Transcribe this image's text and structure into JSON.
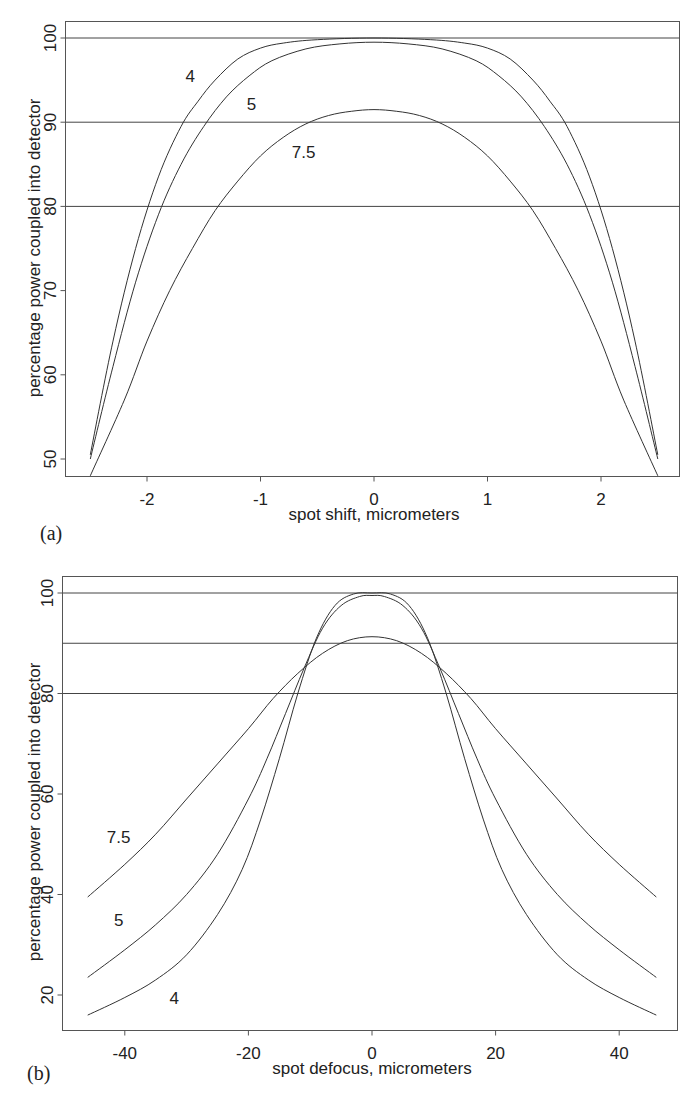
{
  "figure": {
    "panels": [
      "(a)",
      "(b)"
    ]
  },
  "chart_data": [
    {
      "type": "line",
      "panel_label": "(a)",
      "title": "",
      "xlabel": "spot shift, micrometers",
      "ylabel": "percentage power coupled into detector",
      "xlim": [
        -2.7,
        2.7
      ],
      "ylim": [
        48,
        102
      ],
      "xticks": [
        -2,
        -1,
        0,
        1,
        2
      ],
      "yticks": [
        50,
        60,
        70,
        80,
        90,
        100
      ],
      "grid": false,
      "reference_lines_y": [
        80,
        90,
        100
      ],
      "legend": "inline curve labels",
      "series": [
        {
          "name": "4",
          "label_pos": [
            -1.62,
            95.5
          ],
          "x": [
            -2.5,
            -2.3,
            -2.1,
            -1.9,
            -1.7,
            -1.55,
            -1.4,
            -1.2,
            -1.0,
            -0.8,
            -0.5,
            0,
            0.5,
            0.8,
            1.0,
            1.2,
            1.4,
            1.55,
            1.7,
            1.9,
            2.1,
            2.3,
            2.5
          ],
          "y": [
            50.5,
            64,
            75,
            83.5,
            89.5,
            92.5,
            95,
            97.5,
            98.8,
            99.4,
            99.8,
            100,
            99.8,
            99.4,
            98.8,
            97.5,
            95,
            92.5,
            89.5,
            83.5,
            75,
            64,
            50.5
          ]
        },
        {
          "name": "5",
          "label_pos": [
            -1.08,
            92.2
          ],
          "x": [
            -2.5,
            -2.3,
            -2.1,
            -1.9,
            -1.7,
            -1.5,
            -1.3,
            -1.1,
            -0.9,
            -0.6,
            -0.3,
            0,
            0.3,
            0.6,
            0.9,
            1.1,
            1.3,
            1.5,
            1.7,
            1.9,
            2.1,
            2.3,
            2.5
          ],
          "y": [
            50,
            61,
            71,
            79,
            85,
            89.5,
            93,
            95.5,
            97.3,
            98.7,
            99.3,
            99.5,
            99.3,
            98.7,
            97.3,
            95.5,
            93,
            89.5,
            85,
            79,
            71,
            61,
            50
          ]
        },
        {
          "name": "7.5",
          "label_pos": [
            -0.62,
            86.5
          ],
          "x": [
            -2.5,
            -2.2,
            -2.0,
            -1.8,
            -1.6,
            -1.4,
            -1.2,
            -1.0,
            -0.8,
            -0.6,
            -0.4,
            -0.2,
            0,
            0.2,
            0.4,
            0.6,
            0.8,
            1.0,
            1.2,
            1.4,
            1.6,
            1.8,
            2.0,
            2.2,
            2.5
          ],
          "y": [
            48,
            57,
            64,
            70,
            75,
            79.5,
            83,
            86,
            88.2,
            89.8,
            90.8,
            91.3,
            91.5,
            91.3,
            90.8,
            89.8,
            88.2,
            86,
            83,
            79.5,
            75,
            70,
            64,
            57,
            48
          ]
        }
      ]
    },
    {
      "type": "line",
      "panel_label": "(b)",
      "title": "",
      "xlabel": "spot defocus, micrometers",
      "ylabel": "percentage power coupled into detector",
      "xlim": [
        -50,
        50
      ],
      "ylim": [
        13,
        103
      ],
      "xticks": [
        -40,
        -20,
        0,
        20,
        40
      ],
      "yticks": [
        20,
        40,
        60,
        80,
        100
      ],
      "grid": false,
      "reference_lines_y": [
        80,
        90,
        100
      ],
      "legend": "inline curve labels",
      "series": [
        {
          "name": "7.5",
          "label_pos": [
            -41,
            51.5
          ],
          "x": [
            -46,
            -40,
            -35,
            -30,
            -25,
            -20,
            -16,
            -12,
            -8,
            -4,
            0,
            4,
            8,
            12,
            16,
            20,
            25,
            30,
            35,
            40,
            46
          ],
          "y": [
            39.5,
            46,
            52,
            59,
            66,
            73,
            79,
            84,
            88,
            90.5,
            91.3,
            90.5,
            88,
            84,
            79,
            73,
            66,
            59,
            52,
            46,
            39.5
          ]
        },
        {
          "name": "5",
          "label_pos": [
            -41,
            35
          ],
          "x": [
            -46,
            -40,
            -35,
            -30,
            -25,
            -20,
            -17,
            -14,
            -11,
            -8,
            -5,
            -2,
            0,
            2,
            5,
            8,
            11,
            14,
            17,
            20,
            25,
            30,
            35,
            40,
            46
          ],
          "y": [
            23.5,
            29,
            34,
            40,
            48,
            59,
            67,
            76,
            85,
            93,
            97.5,
            99.3,
            99.5,
            99.3,
            97.5,
            93,
            85,
            76,
            67,
            59,
            48,
            40,
            34,
            29,
            23.5
          ]
        },
        {
          "name": "4",
          "label_pos": [
            -32,
            19.5
          ],
          "x": [
            -46,
            -40,
            -35,
            -30,
            -25,
            -21,
            -18,
            -15,
            -12,
            -9,
            -6,
            -3,
            0,
            3,
            6,
            9,
            12,
            15,
            18,
            21,
            25,
            30,
            35,
            40,
            46
          ],
          "y": [
            16,
            19.5,
            23,
            28,
            36,
            45,
            55,
            67,
            80,
            91,
            97.5,
            99.8,
            100,
            99.8,
            97.5,
            91,
            80,
            67,
            55,
            45,
            36,
            28,
            23,
            19.5,
            16
          ]
        }
      ]
    }
  ]
}
